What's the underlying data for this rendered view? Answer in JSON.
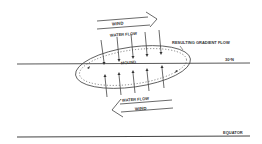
{
  "diagram": {
    "labels": {
      "wind_top": "WIND",
      "water_flow_top": "WATER FLOW",
      "resulting_gradient_flow": "RESULTING GRADIENT FLOW",
      "lat_30n": "30°N",
      "mound": "MOUND",
      "water_flow_bottom": "WATER FLOW",
      "wind_bottom": "WIND",
      "equator": "EQUATOR"
    },
    "colors": {
      "ink": "#333333",
      "background": "#ffffff"
    }
  }
}
